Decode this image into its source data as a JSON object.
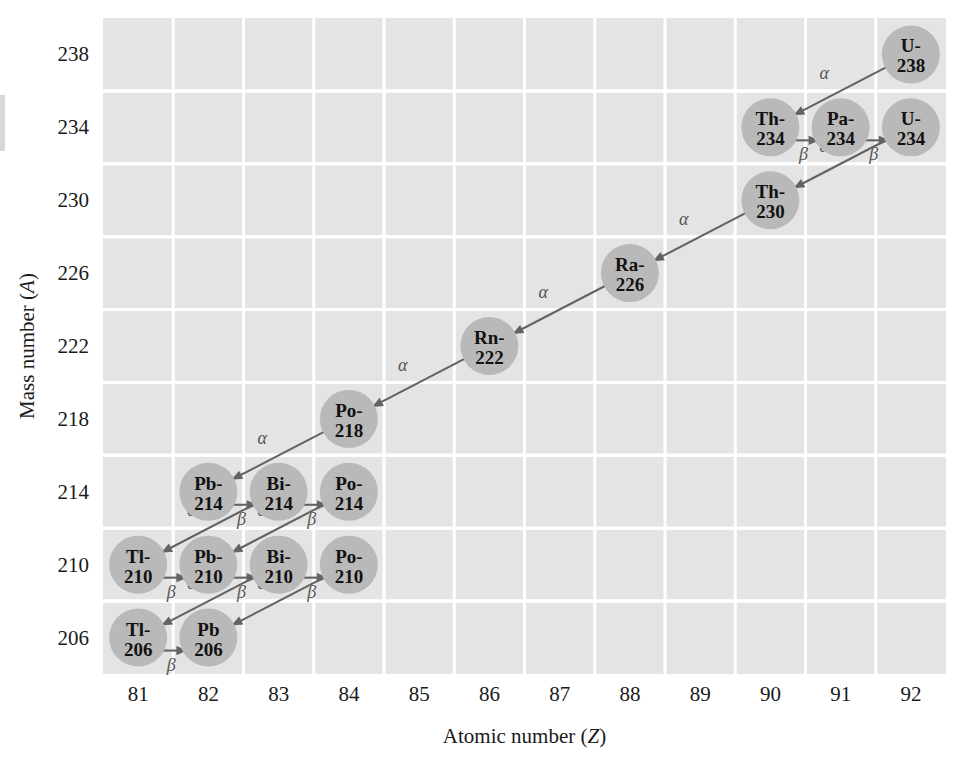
{
  "figure": {
    "background_color": "#ffffff",
    "plot_background_color": "#e4e4e4",
    "gridline_color": "#ffffff",
    "circle_color": "#b9b9b9",
    "arrow_color": "#636363"
  },
  "axes": {
    "x": {
      "label": "Atomic number (",
      "label_symbol": "Z",
      "label_close": ")",
      "ticks": [
        "81",
        "82",
        "83",
        "84",
        "85",
        "86",
        "87",
        "88",
        "89",
        "90",
        "91",
        "92"
      ],
      "min": 80.5,
      "max": 92.5
    },
    "y": {
      "label": "Mass number (",
      "label_symbol": "A",
      "label_close": ")",
      "ticks": [
        "206",
        "210",
        "214",
        "218",
        "222",
        "226",
        "230",
        "234",
        "238"
      ],
      "min": 204,
      "max": 240
    }
  },
  "chart_data": {
    "type": "scatter",
    "xlabel": "Atomic number (Z)",
    "ylabel": "Mass number (A)",
    "xlim": [
      80.5,
      92.5
    ],
    "ylim": [
      204,
      240
    ],
    "grid": true,
    "legend": "none",
    "nuclides": [
      {
        "label_top": "U-",
        "label_bottom": "238",
        "name": "U-238",
        "z": 92,
        "a": 238
      },
      {
        "label_top": "Th-",
        "label_bottom": "234",
        "name": "Th-234",
        "z": 90,
        "a": 234
      },
      {
        "label_top": "Pa-",
        "label_bottom": "234",
        "name": "Pa-234",
        "z": 91,
        "a": 234
      },
      {
        "label_top": "U-",
        "label_bottom": "234",
        "name": "U-234",
        "z": 92,
        "a": 234
      },
      {
        "label_top": "Th-",
        "label_bottom": "230",
        "name": "Th-230",
        "z": 90,
        "a": 230
      },
      {
        "label_top": "Ra-",
        "label_bottom": "226",
        "name": "Ra-226",
        "z": 88,
        "a": 226
      },
      {
        "label_top": "Rn-",
        "label_bottom": "222",
        "name": "Rn-222",
        "z": 86,
        "a": 222
      },
      {
        "label_top": "Po-",
        "label_bottom": "218",
        "name": "Po-218",
        "z": 84,
        "a": 218
      },
      {
        "label_top": "Pb-",
        "label_bottom": "214",
        "name": "Pb-214",
        "z": 82,
        "a": 214
      },
      {
        "label_top": "Bi-",
        "label_bottom": "214",
        "name": "Bi-214",
        "z": 83,
        "a": 214
      },
      {
        "label_top": "Po-",
        "label_bottom": "214",
        "name": "Po-214",
        "z": 84,
        "a": 214
      },
      {
        "label_top": "Tl-",
        "label_bottom": "210",
        "name": "Tl-210",
        "z": 81,
        "a": 210
      },
      {
        "label_top": "Pb-",
        "label_bottom": "210",
        "name": "Pb-210",
        "z": 82,
        "a": 210
      },
      {
        "label_top": "Bi-",
        "label_bottom": "210",
        "name": "Bi-210",
        "z": 83,
        "a": 210
      },
      {
        "label_top": "Po-",
        "label_bottom": "210",
        "name": "Po-210",
        "z": 84,
        "a": 210
      },
      {
        "label_top": "Tl-",
        "label_bottom": "206",
        "name": "Tl-206",
        "z": 81,
        "a": 206
      },
      {
        "label_top": "Pb",
        "label_bottom": "206",
        "name": "Pb 206",
        "z": 82,
        "a": 206
      }
    ],
    "decays": [
      {
        "from": "U-238",
        "to": "Th-234",
        "type": "alpha",
        "symbol": "α"
      },
      {
        "from": "Th-234",
        "to": "Pa-234",
        "type": "beta",
        "symbol": "β"
      },
      {
        "from": "Pa-234",
        "to": "U-234",
        "type": "beta",
        "symbol": "β"
      },
      {
        "from": "U-234",
        "to": "Th-230",
        "type": "alpha",
        "symbol": "α"
      },
      {
        "from": "Th-230",
        "to": "Ra-226",
        "type": "alpha",
        "symbol": "α"
      },
      {
        "from": "Ra-226",
        "to": "Rn-222",
        "type": "alpha",
        "symbol": "α"
      },
      {
        "from": "Rn-222",
        "to": "Po-218",
        "type": "alpha",
        "symbol": "α"
      },
      {
        "from": "Po-218",
        "to": "Pb-214",
        "type": "alpha",
        "symbol": "α"
      },
      {
        "from": "Pb-214",
        "to": "Bi-214",
        "type": "beta",
        "symbol": "β"
      },
      {
        "from": "Bi-214",
        "to": "Po-214",
        "type": "beta",
        "symbol": "β"
      },
      {
        "from": "Bi-214",
        "to": "Tl-210",
        "type": "alpha",
        "symbol": "α"
      },
      {
        "from": "Po-214",
        "to": "Pb-210",
        "type": "alpha",
        "symbol": "α"
      },
      {
        "from": "Tl-210",
        "to": "Pb-210",
        "type": "beta",
        "symbol": "β"
      },
      {
        "from": "Pb-210",
        "to": "Bi-210",
        "type": "beta",
        "symbol": "β"
      },
      {
        "from": "Bi-210",
        "to": "Po-210",
        "type": "beta",
        "symbol": "β"
      },
      {
        "from": "Bi-210",
        "to": "Tl-206",
        "type": "alpha",
        "symbol": "α"
      },
      {
        "from": "Po-210",
        "to": "Pb 206",
        "type": "alpha",
        "symbol": "α"
      },
      {
        "from": "Tl-206",
        "to": "Pb 206",
        "type": "beta",
        "symbol": "β"
      }
    ]
  }
}
